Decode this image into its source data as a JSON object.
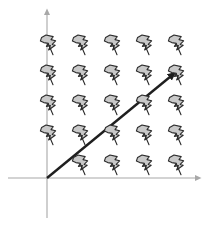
{
  "figure": {
    "background_color": "#ffffff",
    "width": 206,
    "height": 227
  },
  "axes": {
    "color": "#a8a8a8",
    "stroke_width": 1.1,
    "origin": {
      "x": 47,
      "y": 178
    },
    "x_axis": {
      "label": "x-axis",
      "x_start": 8,
      "x_end": 198,
      "y": 178,
      "arrow_end": "right",
      "arrow_size": 6
    },
    "y_axis": {
      "label": "y-axis",
      "y_start": 218,
      "y_end": 12,
      "x": 47,
      "arrow_end": "up",
      "arrow_size": 6
    }
  },
  "vector": {
    "label": "solution-vector",
    "color": "#1f1f1f",
    "stroke_width": 2.4,
    "x1": 47,
    "y1": 178,
    "x2": 174,
    "y2": 73,
    "arrow_head_size": 9,
    "slope_description": "positive diagonal from origin to upper right"
  },
  "glyph": {
    "name": "lightning-bolt-glyph",
    "fill_color": "#c9c9c9",
    "stroke_color": "#2b2b2b",
    "stroke_width": 1.1,
    "scale": 1.0,
    "description": "gray lightning bolt / flag shape with tail to lower right"
  },
  "chart_data": {
    "type": "scatter",
    "xlabel": "",
    "ylabel": "",
    "grid": false,
    "legend": null,
    "xlim": [
      8,
      198
    ],
    "ylim": [
      12,
      218
    ],
    "columns_px": [
      47,
      79,
      111,
      143,
      175
    ],
    "rows_px": [
      45,
      75,
      105,
      135,
      165
    ],
    "omitted_cells": [
      [
        0,
        4
      ]
    ],
    "glyph_count": 24,
    "points": [
      {
        "col": 0,
        "row": 0,
        "x": 47,
        "y": 45
      },
      {
        "col": 1,
        "row": 0,
        "x": 79,
        "y": 45
      },
      {
        "col": 2,
        "row": 0,
        "x": 111,
        "y": 45
      },
      {
        "col": 3,
        "row": 0,
        "x": 143,
        "y": 45
      },
      {
        "col": 4,
        "row": 0,
        "x": 175,
        "y": 45
      },
      {
        "col": 0,
        "row": 1,
        "x": 47,
        "y": 75
      },
      {
        "col": 1,
        "row": 1,
        "x": 79,
        "y": 75
      },
      {
        "col": 2,
        "row": 1,
        "x": 111,
        "y": 75
      },
      {
        "col": 3,
        "row": 1,
        "x": 143,
        "y": 75
      },
      {
        "col": 4,
        "row": 1,
        "x": 175,
        "y": 75
      },
      {
        "col": 0,
        "row": 2,
        "x": 47,
        "y": 105
      },
      {
        "col": 1,
        "row": 2,
        "x": 79,
        "y": 105
      },
      {
        "col": 2,
        "row": 2,
        "x": 111,
        "y": 105
      },
      {
        "col": 3,
        "row": 2,
        "x": 143,
        "y": 105
      },
      {
        "col": 4,
        "row": 2,
        "x": 175,
        "y": 105
      },
      {
        "col": 0,
        "row": 3,
        "x": 47,
        "y": 135
      },
      {
        "col": 1,
        "row": 3,
        "x": 79,
        "y": 135
      },
      {
        "col": 2,
        "row": 3,
        "x": 111,
        "y": 135
      },
      {
        "col": 3,
        "row": 3,
        "x": 143,
        "y": 135
      },
      {
        "col": 4,
        "row": 3,
        "x": 175,
        "y": 135
      },
      {
        "col": 1,
        "row": 4,
        "x": 79,
        "y": 165
      },
      {
        "col": 2,
        "row": 4,
        "x": 111,
        "y": 165
      },
      {
        "col": 3,
        "row": 4,
        "x": 143,
        "y": 165
      },
      {
        "col": 4,
        "row": 4,
        "x": 175,
        "y": 165
      }
    ],
    "series": [
      {
        "name": "solution-line",
        "type": "line",
        "points": [
          [
            47,
            178
          ],
          [
            174,
            73
          ]
        ]
      }
    ]
  }
}
